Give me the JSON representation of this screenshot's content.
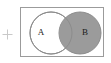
{
  "figure": {
    "type": "venn-diagram",
    "background_color": "#ffffff",
    "frame": {
      "border_color": "#9b9b9b",
      "fill_color": "#ffffff"
    },
    "marker": {
      "icon": "plus-icon",
      "glyph": "+",
      "color": "#c9c9c9"
    },
    "sets": [
      {
        "label": "A",
        "fill_color": "#ffffff",
        "stroke_color": "#8c8c8c",
        "cx": 30,
        "cy": 25,
        "r": 21
      },
      {
        "label": "B",
        "fill_color": "#9b9b9b",
        "stroke_color": "#8c8c8c",
        "cx": 59,
        "cy": 25,
        "r": 21
      }
    ],
    "intersection": {
      "label": "",
      "fill_color": "#9b9b9b",
      "shaded": true
    }
  }
}
